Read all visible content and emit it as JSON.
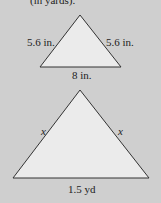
{
  "header_text": "(in yards).",
  "small_triangle": {
    "left_side": "5.6 in.",
    "right_side": "5.6 in.",
    "base": "8 in."
  },
  "large_triangle": {
    "left_side": "x",
    "right_side": "x",
    "base": "1.5 yd"
  },
  "colors": {
    "background": "#cfcfcf",
    "fill": "#ebebeb",
    "stroke": "#333333"
  }
}
